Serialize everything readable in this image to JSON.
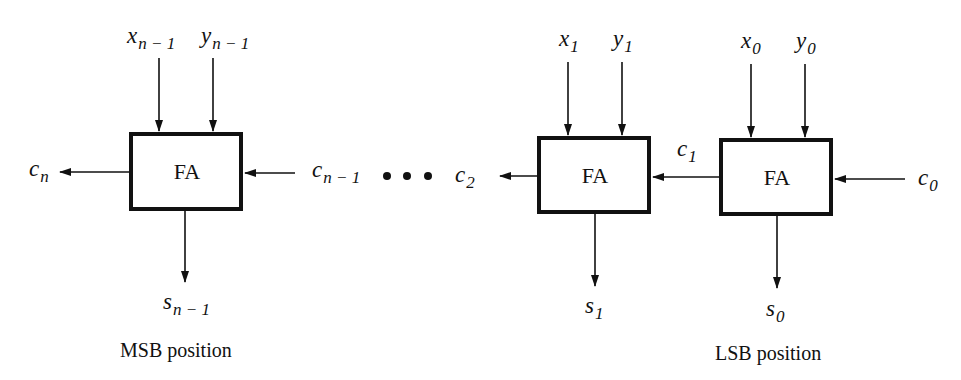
{
  "diagram": {
    "block_label": "FA",
    "blocks": [
      {
        "id": "fa_msb",
        "label": "FA",
        "x_in": {
          "base": "x",
          "sub": "n − 1"
        },
        "y_in": {
          "base": "y",
          "sub": "n − 1"
        },
        "sum_out": {
          "base": "s",
          "sub": "n − 1"
        },
        "carry_out": {
          "base": "c",
          "sub": "n"
        },
        "carry_in": {
          "base": "c",
          "sub": "n − 1"
        }
      },
      {
        "id": "fa_1",
        "label": "FA",
        "x_in": {
          "base": "x",
          "sub": "1"
        },
        "y_in": {
          "base": "y",
          "sub": "1"
        },
        "sum_out": {
          "base": "s",
          "sub": "1"
        },
        "carry_out": {
          "base": "c",
          "sub": "2"
        },
        "carry_in": {
          "base": "c",
          "sub": "1"
        }
      },
      {
        "id": "fa_0",
        "label": "FA",
        "x_in": {
          "base": "x",
          "sub": "0"
        },
        "y_in": {
          "base": "y",
          "sub": "0"
        },
        "sum_out": {
          "base": "s",
          "sub": "0"
        },
        "carry_out": {
          "base": "c",
          "sub": "1"
        },
        "carry_in": {
          "base": "c",
          "sub": "0"
        }
      }
    ],
    "ellipsis": "• • •",
    "captions": {
      "msb": "MSB position",
      "lsb": "LSB position"
    }
  }
}
